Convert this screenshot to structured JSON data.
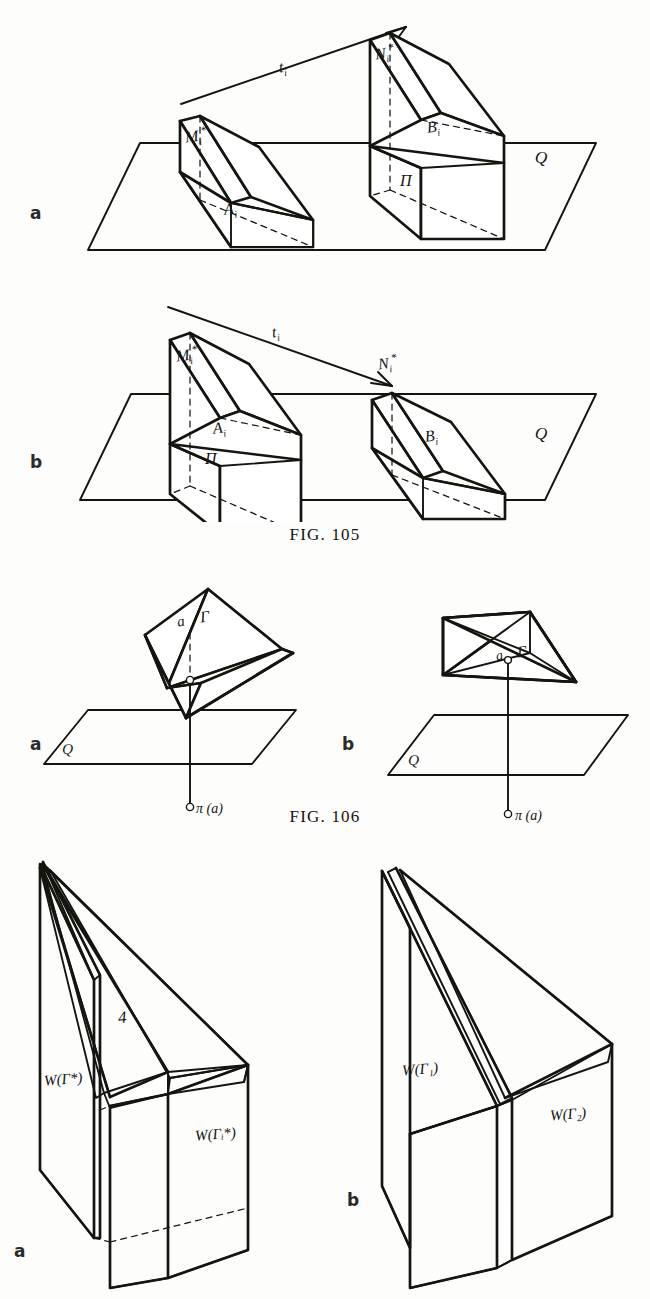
{
  "page": {
    "width": 650,
    "height": 1299,
    "background": "#fdfdfb",
    "ink": "#15150f"
  },
  "figures": [
    {
      "id": "fig-105",
      "caption": "FIG. 105",
      "panels": [
        {
          "letter": "a",
          "description": "Two wedge-shaped prisms standing on plane Q, translation vector t_i pointing up-right from the left solid to the right solid.",
          "labels": [
            {
              "name": "vertex-label-M",
              "text": "M",
              "sub": "i",
              "sup": "*"
            },
            {
              "name": "vertex-label-A",
              "text": "A",
              "sub": "i",
              "sup": ""
            },
            {
              "name": "vertex-label-N",
              "text": "N",
              "sub": "i",
              "sup": "*"
            },
            {
              "name": "vertex-label-B",
              "text": "B",
              "sub": "i",
              "sup": ""
            },
            {
              "name": "region-label-Pi",
              "text": "Π",
              "sub": "",
              "sup": ""
            },
            {
              "name": "plane-label-Q",
              "text": "Q",
              "sub": "",
              "sup": ""
            },
            {
              "name": "vector-label-t",
              "text": "t",
              "sub": "i",
              "sup": ""
            }
          ]
        },
        {
          "letter": "b",
          "description": "Mirror configuration: the tall prism is at left on plane Q, the small prism at right, translation vector t_i points down-right.",
          "labels": [
            {
              "name": "vertex-label-M",
              "text": "M",
              "sub": "i",
              "sup": "*"
            },
            {
              "name": "vertex-label-A",
              "text": "A",
              "sub": "i",
              "sup": ""
            },
            {
              "name": "vertex-label-N",
              "text": "N",
              "sub": "i",
              "sup": "*"
            },
            {
              "name": "vertex-label-B",
              "text": "B",
              "sub": "i",
              "sup": ""
            },
            {
              "name": "region-label-Pi",
              "text": "Π",
              "sub": "",
              "sup": ""
            },
            {
              "name": "plane-label-Q",
              "text": "Q",
              "sub": "",
              "sup": ""
            },
            {
              "name": "vector-label-t",
              "text": "t",
              "sub": "i",
              "sup": ""
            }
          ]
        }
      ]
    },
    {
      "id": "fig-106",
      "caption": "FIG. 106",
      "panels": [
        {
          "letter": "a",
          "description": "Tetrahedron tilted, with hatched face Γ containing point a; a vertical dashed-then-solid segment drops to the point π(a) on plane Q.",
          "labels": [
            {
              "name": "point-label-a",
              "text": "a",
              "sub": "",
              "sup": ""
            },
            {
              "name": "face-label-Gamma",
              "text": "Γ",
              "sub": "",
              "sup": ""
            },
            {
              "name": "projection-label",
              "text": "π (a)",
              "sub": "",
              "sup": ""
            },
            {
              "name": "plane-label-Q",
              "text": "Q",
              "sub": "",
              "sup": ""
            }
          ]
        },
        {
          "letter": "b",
          "description": "Tetrahedron resting flat, hatched bottom face Γ containing point a; a vertical segment drops to the point π(a) on plane Q.",
          "labels": [
            {
              "name": "point-label-a",
              "text": "a",
              "sub": "",
              "sup": ""
            },
            {
              "name": "face-label-Gamma",
              "text": "Γ",
              "sub": "",
              "sup": ""
            },
            {
              "name": "projection-label",
              "text": "π (a)",
              "sub": "",
              "sup": ""
            },
            {
              "name": "plane-label-Q",
              "text": "Q",
              "sub": "",
              "sup": ""
            }
          ]
        }
      ]
    },
    {
      "id": "fig-107",
      "caption": "",
      "panels": [
        {
          "letter": "a",
          "description": "Two interleaved hatched wedge solids; a thin blade-like wedge in front of a blocky wedge.",
          "labels": [
            {
              "name": "edge-label-delta",
              "text": "4",
              "sub": "",
              "sup": ""
            },
            {
              "name": "solid-label-W-Gamma-star",
              "text": "W(Γ*)",
              "sub": "",
              "sup": ""
            },
            {
              "name": "solid-label-W-Gamma-i-star",
              "text": "W(Γᵢ*)",
              "sub": "",
              "sup": ""
            }
          ]
        },
        {
          "letter": "b",
          "description": "Two parallel hatched wedge solids side by side, left one labelled W(Γ1), right one W(Γ2).",
          "labels": [
            {
              "name": "solid-label-W-Gamma-1",
              "text": "W(Γ₁)",
              "sub": "",
              "sup": ""
            },
            {
              "name": "solid-label-W-Gamma-2",
              "text": "W(Γ₂)",
              "sub": "",
              "sup": ""
            }
          ]
        }
      ]
    }
  ]
}
